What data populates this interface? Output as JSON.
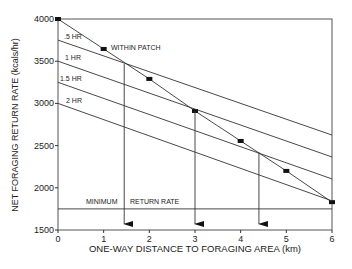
{
  "chart_data": {
    "type": "line",
    "title": "",
    "xlabel": "ONE-WAY DISTANCE TO FORAGING AREA (km)",
    "ylabel": "NET FORAGING RETURN RATE (kcals/hr)",
    "xlim": [
      0,
      6
    ],
    "ylim": [
      1500,
      4000
    ],
    "grid": false,
    "x_ticks": [
      0,
      1,
      2,
      3,
      4,
      5,
      6
    ],
    "y_ticks": [
      1500,
      2000,
      2500,
      3000,
      3500,
      4000
    ],
    "series": [
      {
        "name": "WITHIN PATCH",
        "marker": "square",
        "x": [
          0,
          1,
          2,
          3,
          4,
          5,
          6
        ],
        "values": [
          4000,
          3645,
          3290,
          2910,
          2555,
          2200,
          1830
        ]
      },
      {
        "name": ".5 HR",
        "x": [
          0,
          6
        ],
        "values": [
          3750,
          2625
        ]
      },
      {
        "name": "1 HR",
        "x": [
          0,
          6
        ],
        "values": [
          3500,
          2365
        ]
      },
      {
        "name": "1.5 HR",
        "x": [
          0,
          6
        ],
        "values": [
          3250,
          2105
        ]
      },
      {
        "name": "2 HR",
        "x": [
          0,
          6
        ],
        "values": [
          3000,
          1845
        ]
      }
    ],
    "reference_line": {
      "label_left": "MINIMUM",
      "label_right": "RETURN RATE",
      "y": 1750
    },
    "arrows": [
      {
        "x": 1.45,
        "from_y": 3470
      },
      {
        "x": 3.0,
        "from_y": 2910
      },
      {
        "x": 4.4,
        "from_y": 2420
      }
    ],
    "annotations": [
      ".5 HR",
      "1 HR",
      "1.5 HR",
      "2 HR",
      "WITHIN PATCH"
    ]
  }
}
